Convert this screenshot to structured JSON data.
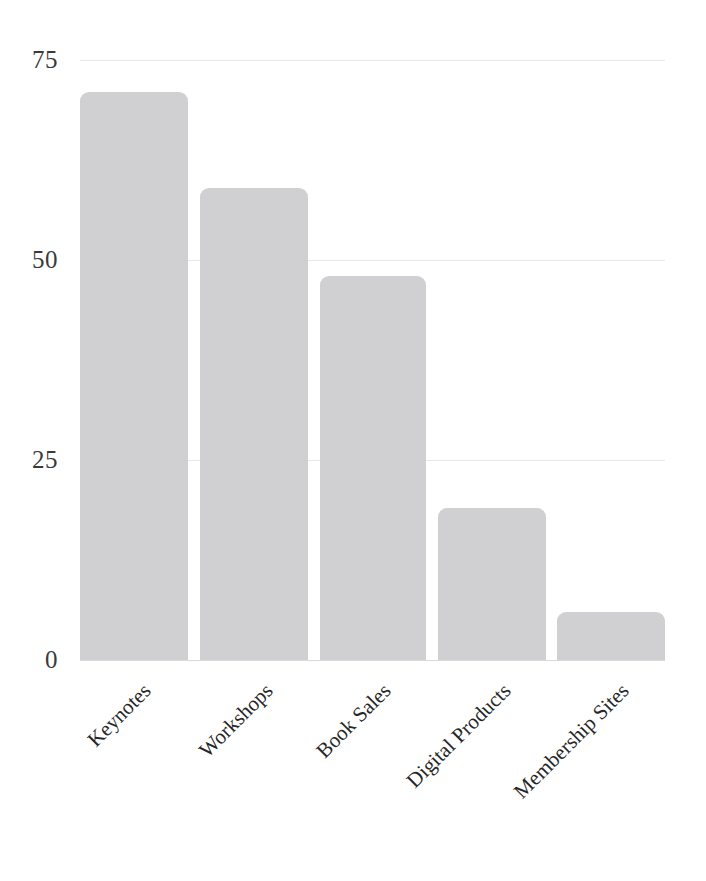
{
  "chart_data": {
    "type": "bar",
    "title": "",
    "subtitle": "",
    "xlabel": "",
    "ylabel": "",
    "categories": [
      "Keynotes",
      "Workshops",
      "Book Sales",
      "Digital Products",
      "Membership Sites"
    ],
    "values": [
      71,
      59,
      48,
      19,
      6
    ],
    "series": [
      {
        "name": "Revenue",
        "values": [
          71,
          59,
          48,
          19,
          6
        ]
      }
    ],
    "ylim": [
      0,
      75
    ],
    "yticks": [
      0,
      25,
      50,
      75
    ],
    "ytick_labels": [
      "0",
      "25",
      "50",
      "75"
    ],
    "xtick_labels": [
      "Keynotes",
      "Workshops",
      "Book Sales",
      "Digital Products",
      "Membership Sites"
    ],
    "xtick_rotation": -45,
    "grid": true,
    "grid_axis": "y",
    "legend": false,
    "legend_position": "none",
    "annotations": [],
    "bar_color": "#d0d0d2",
    "gridline_color": "#e8e8ea",
    "axis_color": "#d9d9dc",
    "tick_text_color": "#3a3a3a",
    "category_text_color": "#262626",
    "background_color": "#ffffff"
  },
  "axis": {
    "y_ticks": [
      {
        "label": "75",
        "value": 75
      },
      {
        "label": "50",
        "value": 50
      },
      {
        "label": "25",
        "value": 25
      },
      {
        "label": "0",
        "value": 0
      }
    ]
  },
  "bars": [
    {
      "label": "Keynotes",
      "value": 71
    },
    {
      "label": "Workshops",
      "value": 59
    },
    {
      "label": "Book Sales",
      "value": 48
    },
    {
      "label": "Digital Products",
      "value": 19
    },
    {
      "label": "Membership Sites",
      "value": 6
    }
  ]
}
